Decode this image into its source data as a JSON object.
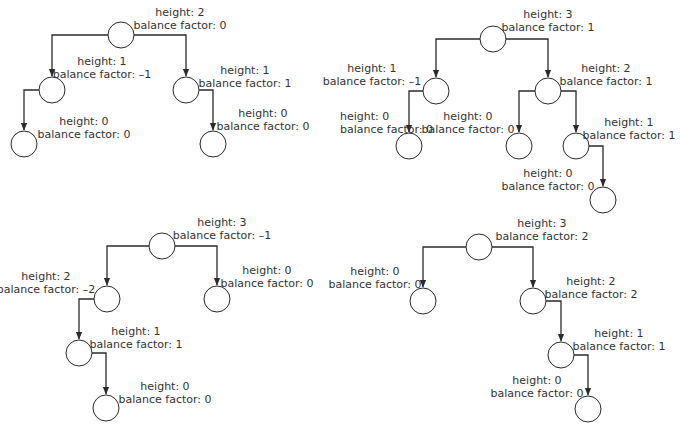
{
  "diagram": {
    "colors": {
      "stroke": "#2b2b2b",
      "text": "#333333",
      "background": "#ffffff"
    },
    "node_radius": 13,
    "trees": [
      {
        "id": "tree-1",
        "nodes": [
          {
            "id": "t1n0",
            "cx": 121,
            "cy": 35,
            "height": "height: 2",
            "bf": "balance factor: 0",
            "lx": 180,
            "ly": 16,
            "anchor": "middle"
          },
          {
            "id": "t1n1",
            "cx": 52,
            "cy": 90,
            "height": "height: 1",
            "bf": "balance factor: –1",
            "lx": 102,
            "ly": 65,
            "anchor": "middle"
          },
          {
            "id": "t1n2",
            "cx": 186,
            "cy": 90,
            "height": "height: 1",
            "bf": "balance factor: 1",
            "lx": 245,
            "ly": 74,
            "anchor": "middle"
          },
          {
            "id": "t1n3",
            "cx": 24,
            "cy": 144,
            "height": "height: 0",
            "bf": "balance factor: 0",
            "lx": 84,
            "ly": 125,
            "anchor": "middle"
          },
          {
            "id": "t1n4",
            "cx": 213,
            "cy": 144,
            "height": "height: 0",
            "bf": "balance factor: 0",
            "lx": 263,
            "ly": 117,
            "anchor": "middle"
          }
        ],
        "edges": [
          {
            "from": "t1n0",
            "to": "t1n1",
            "side": "left"
          },
          {
            "from": "t1n0",
            "to": "t1n2",
            "side": "right"
          },
          {
            "from": "t1n1",
            "to": "t1n3",
            "side": "left"
          },
          {
            "from": "t1n2",
            "to": "t1n4",
            "side": "right"
          }
        ]
      },
      {
        "id": "tree-2",
        "nodes": [
          {
            "id": "t2n0",
            "cx": 493,
            "cy": 39,
            "height": "height: 3",
            "bf": "balance factor: 1",
            "lx": 548,
            "ly": 18,
            "anchor": "middle"
          },
          {
            "id": "t2n1",
            "cx": 436,
            "cy": 91,
            "height": "height: 1",
            "bf": "balance factor: –1",
            "lx": 372,
            "ly": 72,
            "anchor": "middle"
          },
          {
            "id": "t2n2",
            "cx": 548,
            "cy": 91,
            "height": "height: 2",
            "bf": "balance factor: 1",
            "lx": 606,
            "ly": 72,
            "anchor": "middle"
          },
          {
            "id": "t2n3",
            "cx": 409,
            "cy": 146,
            "height": "height: 0",
            "bf": "balance factor: 0",
            "lx": 340,
            "ly": 120,
            "anchor": "start"
          },
          {
            "id": "t2n4",
            "cx": 519,
            "cy": 146,
            "height": "height: 0",
            "bf": "balance factor: 0",
            "lx": 468,
            "ly": 120,
            "anchor": "middle"
          },
          {
            "id": "t2n5",
            "cx": 576,
            "cy": 146,
            "height": "height: 1",
            "bf": "balance factor: 1",
            "lx": 629,
            "ly": 126,
            "anchor": "middle"
          },
          {
            "id": "t2n6",
            "cx": 603,
            "cy": 200,
            "height": "height: 0",
            "bf": "balance factor: 0",
            "lx": 548,
            "ly": 177,
            "anchor": "middle"
          }
        ],
        "edges": [
          {
            "from": "t2n0",
            "to": "t2n1",
            "side": "left"
          },
          {
            "from": "t2n0",
            "to": "t2n2",
            "side": "right"
          },
          {
            "from": "t2n1",
            "to": "t2n3",
            "side": "left"
          },
          {
            "from": "t2n2",
            "to": "t2n4",
            "side": "left"
          },
          {
            "from": "t2n2",
            "to": "t2n5",
            "side": "right"
          },
          {
            "from": "t2n5",
            "to": "t2n6",
            "side": "right"
          }
        ]
      },
      {
        "id": "tree-3",
        "nodes": [
          {
            "id": "t3n0",
            "cx": 162,
            "cy": 246,
            "height": "height: 3",
            "bf": "balance factor: –1",
            "lx": 222,
            "ly": 226,
            "anchor": "middle"
          },
          {
            "id": "t3n1",
            "cx": 107,
            "cy": 299,
            "height": "height: 2",
            "bf": "balance factor: –2",
            "lx": 46,
            "ly": 280,
            "anchor": "middle"
          },
          {
            "id": "t3n2",
            "cx": 217,
            "cy": 299,
            "height": "height: 0",
            "bf": "balance factor: 0",
            "lx": 267,
            "ly": 274,
            "anchor": "middle"
          },
          {
            "id": "t3n3",
            "cx": 79,
            "cy": 353,
            "height": "height: 1",
            "bf": "balance factor: 1",
            "lx": 136,
            "ly": 335,
            "anchor": "middle"
          },
          {
            "id": "t3n4",
            "cx": 106,
            "cy": 408,
            "height": "height: 0",
            "bf": "balance factor: 0",
            "lx": 165,
            "ly": 390,
            "anchor": "middle"
          }
        ],
        "edges": [
          {
            "from": "t3n0",
            "to": "t3n1",
            "side": "left"
          },
          {
            "from": "t3n0",
            "to": "t3n2",
            "side": "right"
          },
          {
            "from": "t3n1",
            "to": "t3n3",
            "side": "left"
          },
          {
            "from": "t3n3",
            "to": "t3n4",
            "side": "right"
          }
        ]
      },
      {
        "id": "tree-4",
        "nodes": [
          {
            "id": "t4n0",
            "cx": 479,
            "cy": 247,
            "height": "height: 3",
            "bf": "balance factor: 2",
            "lx": 542,
            "ly": 227,
            "anchor": "middle"
          },
          {
            "id": "t4n1",
            "cx": 423,
            "cy": 301,
            "height": "height: 0",
            "bf": "balance factor: 0",
            "lx": 375,
            "ly": 275,
            "anchor": "middle"
          },
          {
            "id": "t4n2",
            "cx": 533,
            "cy": 301,
            "height": "height: 2",
            "bf": "balance factor: 2",
            "lx": 591,
            "ly": 285,
            "anchor": "middle"
          },
          {
            "id": "t4n3",
            "cx": 561,
            "cy": 355,
            "height": "height: 1",
            "bf": "balance factor: 1",
            "lx": 619,
            "ly": 337,
            "anchor": "middle"
          },
          {
            "id": "t4n4",
            "cx": 588,
            "cy": 409,
            "height": "height: 0",
            "bf": "balance factor: 0",
            "lx": 537,
            "ly": 384,
            "anchor": "middle"
          }
        ],
        "edges": [
          {
            "from": "t4n0",
            "to": "t4n1",
            "side": "left"
          },
          {
            "from": "t4n0",
            "to": "t4n2",
            "side": "right"
          },
          {
            "from": "t4n2",
            "to": "t4n3",
            "side": "right"
          },
          {
            "from": "t4n3",
            "to": "t4n4",
            "side": "right"
          }
        ]
      }
    ]
  }
}
